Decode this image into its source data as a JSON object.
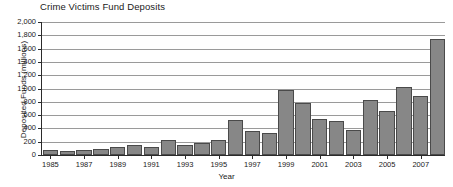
{
  "chart_data": {
    "type": "bar",
    "title": "Crime Victims Fund Deposits",
    "xlabel": "Year",
    "ylabel": "Deposited Funds (millions)",
    "ylim": [
      0,
      2000
    ],
    "ytick_labels": [
      "0",
      "200",
      "400",
      "600",
      "800",
      "1,000",
      "1,200",
      "1,400",
      "1,600",
      "1,800",
      "2,000"
    ],
    "ytick_values": [
      0,
      200,
      400,
      600,
      800,
      1000,
      1200,
      1400,
      1600,
      1800,
      2000
    ],
    "xtick_labels": [
      "1985",
      "1987",
      "1989",
      "1991",
      "1993",
      "1995",
      "1997",
      "1999",
      "2001",
      "2003",
      "2005",
      "2007"
    ],
    "grid": true,
    "legend": null,
    "bar_color": "#878787",
    "bar_edge_color": "#4a4a4a",
    "gridline_color": "#9a9a9a",
    "axis_color": "#2b2b2b",
    "categories": [
      1985,
      1986,
      1987,
      1988,
      1989,
      1990,
      1991,
      1992,
      1993,
      1994,
      1995,
      1996,
      1997,
      1998,
      1999,
      2000,
      2001,
      2002,
      2003,
      2004,
      2005,
      2006,
      2007,
      2008
    ],
    "values": [
      68,
      62,
      77,
      93,
      128,
      146,
      128,
      222,
      144,
      185,
      233,
      528,
      363,
      338,
      985,
      777,
      544,
      519,
      380,
      825,
      661,
      1019,
      893,
      1750
    ]
  }
}
